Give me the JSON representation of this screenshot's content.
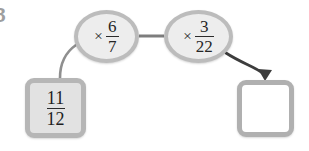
{
  "diagram": {
    "type": "function-machine",
    "question_number": "8",
    "input": {
      "label": "11/12",
      "numerator": "11",
      "denominator": "12",
      "fill_color": "#e2e2e2",
      "border_color": "#b6b6b6"
    },
    "operations": [
      {
        "symbol": "×",
        "numerator": "6",
        "denominator": "7",
        "label": "× 6/7",
        "fill_color": "#ededed",
        "border_color": "#bcbcbc"
      },
      {
        "symbol": "×",
        "numerator": "3",
        "denominator": "22",
        "label": "× 3/22",
        "fill_color": "#ededed",
        "border_color": "#bcbcbc"
      }
    ],
    "output": {
      "value": "",
      "fill_color": "#ffffff",
      "border_color": "#b0b0b0"
    },
    "connectors": {
      "input_to_op1": "curved-line",
      "op1_to_op2": "straight-line",
      "op2_to_output": "curved-arrow",
      "line_color": "#9a9a9a",
      "arrow_color": "#3d3d3d"
    }
  }
}
